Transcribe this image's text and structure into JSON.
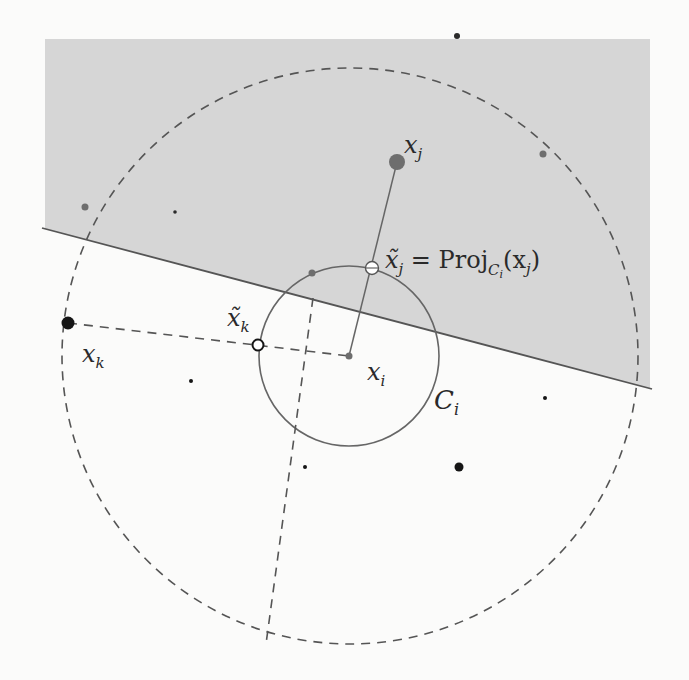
{
  "diagram": {
    "colors": {
      "shaded_region": "#d6d6d6",
      "background": "#fbfbfa",
      "line": "#555555",
      "dot_dark": "#151515",
      "dot_gray": "#6e6e6e"
    },
    "labels": {
      "x_j": "x",
      "x_j_sub": "j",
      "x_j_tilde": "x̃",
      "x_j_tilde_sub": "j",
      "proj_eq": " = Proj",
      "proj_sub": "C",
      "proj_sub_sub": "i",
      "proj_arg": "(x",
      "proj_arg_sub": "j",
      "proj_close": ")",
      "x_k": "x",
      "x_k_sub": "k",
      "x_k_tilde": "x̃",
      "x_k_tilde_sub": "k",
      "x_i": "x",
      "x_i_sub": "i",
      "C_i": "C",
      "C_i_sub": "i"
    },
    "points": [
      {
        "name": "x_j",
        "cx": 397,
        "cy": 162,
        "r": 8,
        "style": "gray"
      },
      {
        "name": "x_j_tilde",
        "cx": 372,
        "cy": 268,
        "r": 6,
        "style": "hollow"
      },
      {
        "name": "x_i",
        "cx": 349,
        "cy": 356,
        "r": 3.5,
        "style": "gray"
      },
      {
        "name": "x_k",
        "cx": 68,
        "cy": 323,
        "r": 6.5,
        "style": "dark"
      },
      {
        "name": "x_k_tilde",
        "cx": 258,
        "cy": 345,
        "r": 5.5,
        "style": "hollow"
      },
      {
        "name": "dot_1",
        "cx": 457,
        "cy": 36,
        "r": 3,
        "style": "dark"
      },
      {
        "name": "dot_2",
        "cx": 543,
        "cy": 154,
        "r": 3.5,
        "style": "gray"
      },
      {
        "name": "dot_3",
        "cx": 85,
        "cy": 207,
        "r": 3.5,
        "style": "gray"
      },
      {
        "name": "dot_4",
        "cx": 175,
        "cy": 212,
        "r": 1.8,
        "style": "dark"
      },
      {
        "name": "dot_5",
        "cx": 312,
        "cy": 273,
        "r": 3.5,
        "style": "gray"
      },
      {
        "name": "dot_6",
        "cx": 191,
        "cy": 381,
        "r": 2,
        "style": "dark"
      },
      {
        "name": "dot_7",
        "cx": 545,
        "cy": 398,
        "r": 2,
        "style": "dark"
      },
      {
        "name": "dot_8",
        "cx": 305,
        "cy": 467,
        "r": 2,
        "style": "dark"
      },
      {
        "name": "dot_9",
        "cx": 459,
        "cy": 467,
        "r": 4.5,
        "style": "dark"
      }
    ],
    "circles": {
      "inner": {
        "cx": 349,
        "cy": 356,
        "r": 90
      },
      "outer": {
        "cx": 350,
        "cy": 356,
        "r": 288
      }
    },
    "half_plane_line": {
      "x1": 42,
      "y1": 228,
      "x2": 652,
      "y2": 389
    },
    "shaded_rect": {
      "x": 45,
      "y": 39,
      "w": 605,
      "h": 350
    }
  }
}
